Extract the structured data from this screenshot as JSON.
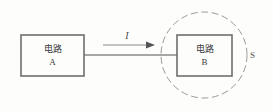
{
  "figure": {
    "background_color": "#fdfdfc",
    "stroke_color": "#6e6e6e",
    "wire_color": "#8a8a8a",
    "dash_color": "#8e8e8e"
  },
  "circuit_a": {
    "title": "电路",
    "designator": "A"
  },
  "circuit_b": {
    "title": "电路",
    "designator": "B"
  },
  "current": {
    "symbol": "I"
  },
  "closed_surface": {
    "label": "S"
  }
}
